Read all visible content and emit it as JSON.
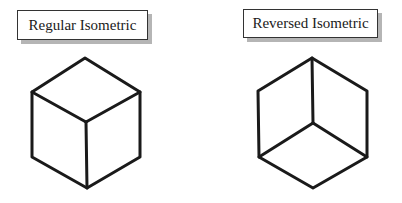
{
  "diagram": {
    "left": {
      "label": "Regular Isometric",
      "cube": {
        "outline": [
          [
            85,
            58
          ],
          [
            140,
            92
          ],
          [
            140,
            157
          ],
          [
            87,
            188
          ],
          [
            32,
            157
          ],
          [
            32,
            92
          ]
        ],
        "inner_edges": [
          [
            [
              32,
              92
            ],
            [
              86,
              122
            ]
          ],
          [
            [
              140,
              92
            ],
            [
              86,
              122
            ]
          ],
          [
            [
              86,
              122
            ],
            [
              87,
              188
            ]
          ]
        ]
      }
    },
    "right": {
      "label": "Reversed Isometric",
      "cube": {
        "outline": [
          [
            312,
            58
          ],
          [
            367,
            91
          ],
          [
            367,
            157
          ],
          [
            313,
            188
          ],
          [
            259,
            157
          ],
          [
            258,
            91
          ]
        ],
        "inner_edges": [
          [
            [
              312,
              58
            ],
            [
              313,
              123
            ]
          ],
          [
            [
              313,
              123
            ],
            [
              259,
              157
            ]
          ],
          [
            [
              313,
              123
            ],
            [
              367,
              157
            ]
          ]
        ]
      }
    },
    "stroke_color": "#1a1a1a",
    "shadow_color": "#b5b5b5"
  }
}
